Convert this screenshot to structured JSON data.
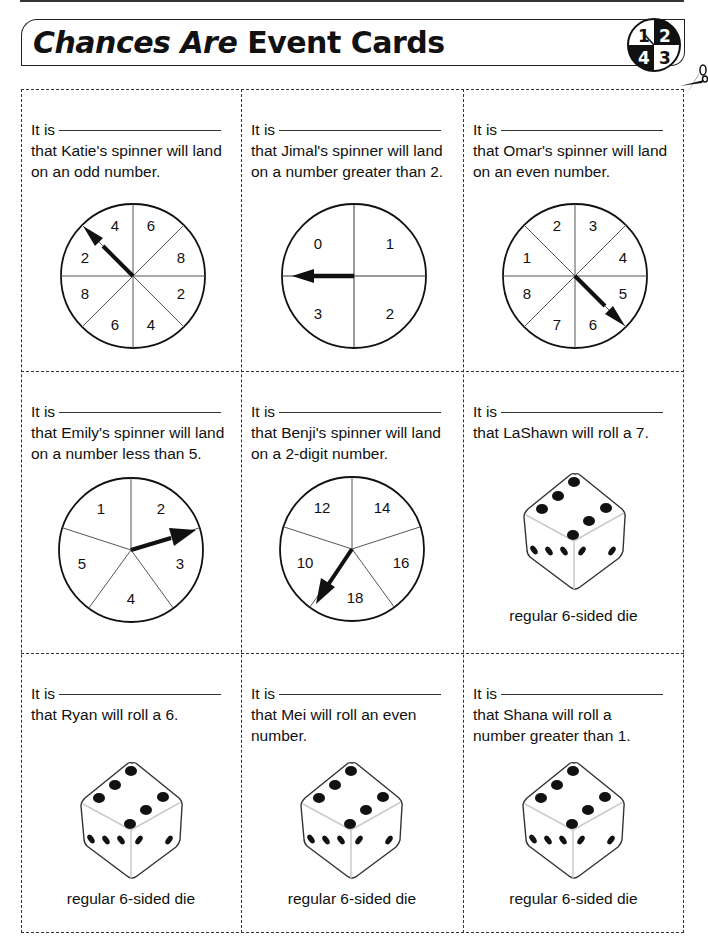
{
  "header": {
    "title_italic": "Chances Are",
    "title_rest": "Event Cards",
    "logo_numbers": [
      "1",
      "2",
      "3",
      "4"
    ]
  },
  "cards": [
    {
      "prefix": "It is",
      "line1": "that Katie's spinner will land",
      "line2": "on an odd number.",
      "type": "spinner",
      "sections": [
        "6",
        "8",
        "2",
        "4",
        "6",
        "8",
        "2",
        "4"
      ]
    },
    {
      "prefix": "It is",
      "line1": "that Jimal's spinner will land",
      "line2": "on a number greater than 2.",
      "type": "spinner",
      "sections": [
        "1",
        "2",
        "3",
        "0"
      ]
    },
    {
      "prefix": "It is",
      "line1": "that Omar's spinner will land",
      "line2": "on an even number.",
      "type": "spinner",
      "sections": [
        "3",
        "4",
        "5",
        "6",
        "7",
        "8",
        "1",
        "2"
      ]
    },
    {
      "prefix": "It is",
      "line1": "that Emily's spinner will land",
      "line2": "on a number less than 5.",
      "type": "spinner",
      "sections": [
        "2",
        "3",
        "4",
        "5",
        "1"
      ]
    },
    {
      "prefix": "It is",
      "line1": "that Benji's spinner will land",
      "line2": "on a 2-digit number.",
      "type": "spinner",
      "sections": [
        "14",
        "16",
        "18",
        "10",
        "12"
      ]
    },
    {
      "prefix": "It is",
      "line1": "that LaShawn will roll a 7.",
      "line2": "",
      "type": "die",
      "caption": "regular 6-sided die"
    },
    {
      "prefix": "It is",
      "line1": "that Ryan will roll a 6.",
      "line2": "",
      "type": "die",
      "caption": "regular 6-sided die"
    },
    {
      "prefix": "It is",
      "line1": "that Mei will roll an even",
      "line2": "number.",
      "type": "die",
      "caption": "regular 6-sided die"
    },
    {
      "prefix": "It is",
      "line1": "that Shana will roll a",
      "line2": "number greater than 1.",
      "type": "die",
      "caption": "regular 6-sided die"
    }
  ]
}
